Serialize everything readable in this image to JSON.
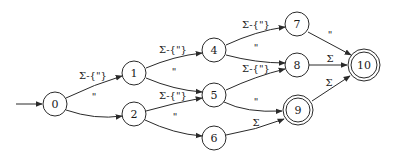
{
  "diagram": {
    "type": "finite-automaton",
    "start_state": "0",
    "nodes": [
      {
        "id": "0",
        "label": "0",
        "accepting": false
      },
      {
        "id": "1",
        "label": "1",
        "accepting": false
      },
      {
        "id": "2",
        "label": "2",
        "accepting": false
      },
      {
        "id": "4",
        "label": "4",
        "accepting": false
      },
      {
        "id": "5",
        "label": "5",
        "accepting": false
      },
      {
        "id": "6",
        "label": "6",
        "accepting": false
      },
      {
        "id": "7",
        "label": "7",
        "accepting": false
      },
      {
        "id": "8",
        "label": "8",
        "accepting": false
      },
      {
        "id": "9",
        "label": "9",
        "accepting": true
      },
      {
        "id": "10",
        "label": "10",
        "accepting": true
      }
    ],
    "edges": [
      {
        "from": "0",
        "to": "1",
        "label": "Σ-{\"}"
      },
      {
        "from": "0",
        "to": "2",
        "label": "\""
      },
      {
        "from": "1",
        "to": "4",
        "label": "Σ-{\"}"
      },
      {
        "from": "1",
        "to": "5",
        "label": "\""
      },
      {
        "from": "2",
        "to": "5",
        "label": "Σ-{\"}"
      },
      {
        "from": "2",
        "to": "6",
        "label": "\""
      },
      {
        "from": "4",
        "to": "7",
        "label": "Σ-{\"}"
      },
      {
        "from": "4",
        "to": "8",
        "label": "\""
      },
      {
        "from": "5",
        "to": "8",
        "label": "Σ-{\"}"
      },
      {
        "from": "5",
        "to": "9",
        "label": "\""
      },
      {
        "from": "6",
        "to": "9",
        "label": "Σ"
      },
      {
        "from": "7",
        "to": "10",
        "label": "\""
      },
      {
        "from": "8",
        "to": "10",
        "label": "Σ"
      },
      {
        "from": "9",
        "to": "10",
        "label": "Σ"
      }
    ]
  }
}
